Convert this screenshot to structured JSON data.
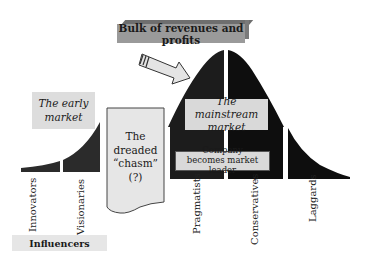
{
  "diagram": {
    "type": "technology-adoption-lifecycle",
    "banner": "Bulk of revenues and profits",
    "early_market": {
      "line1": "The early",
      "line2": "market"
    },
    "chasm": {
      "line1": "The",
      "line2": "dreaded",
      "line3": "“chasm”",
      "line4": "(?)"
    },
    "mainstream_market": {
      "line1": "The mainstream",
      "line2": "market"
    },
    "company": {
      "line1": "Company",
      "line2": "becomes market leader"
    },
    "segments": [
      {
        "label": "Innovators"
      },
      {
        "label": "Visionaries"
      },
      {
        "label": "Pragmatists"
      },
      {
        "label": "Conservatives"
      },
      {
        "label": "Laggards"
      }
    ],
    "influencers": "Influencers",
    "colors": {
      "curve_dark": "#141414",
      "curve_mid": "#2a2a2a",
      "box_fill": "#dcdcdc",
      "banner_fill": "#9a9a9a",
      "arrow_fill": "#e4e4e4"
    }
  }
}
